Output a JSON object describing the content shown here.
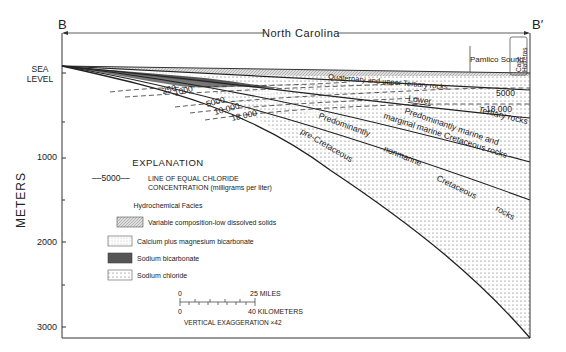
{
  "section": {
    "start_label": "B",
    "end_label": "B′",
    "state_label": "North Carolina",
    "sound_label": "Pamlico Sound",
    "cape_label_1": "Cape",
    "cape_label_2": "Hatteras"
  },
  "axis": {
    "title": "METERS",
    "sea_level_1": "SEA",
    "sea_level_2": "LEVEL",
    "ticks": [
      "1000",
      "2000",
      "3000"
    ]
  },
  "units": {
    "quaternary": "Quaternary and upper Tertiary rocks",
    "lower": "Lower",
    "tertiary": "Tertiary rocks",
    "marine_1": "Predominantly marine and",
    "marine_2": "marginal marine Cretaceous rocks",
    "nonmarine_1": "Predominantly",
    "nonmarine_2": "nonmarine",
    "nonmarine_3": "Cretaceous",
    "nonmarine_4": "rocks",
    "pre_cret": "pre-Cretaceous"
  },
  "isochlors": [
    "250",
    "1000",
    "5000",
    "10,000",
    "18,000",
    "5000",
    "18,000"
  ],
  "legend": {
    "title": "EXPLANATION",
    "line_sample": "––5000––",
    "line_label_1": "LINE OF EQUAL CHLORIDE",
    "line_label_2": "CONCENTRATION (milligrams per liter)",
    "facies_title": "Hydrochemical Facies",
    "facies": [
      {
        "label": "Variable composition-low dissolved solids",
        "pattern": "hatch"
      },
      {
        "label": "Calcium plus magnesium bicarbonate",
        "pattern": "fine-dots"
      },
      {
        "label": "Sodium bicarbonate",
        "pattern": "dark"
      },
      {
        "label": "Sodium chloride",
        "pattern": "dots"
      }
    ]
  },
  "scale": {
    "miles_zero": "0",
    "miles_end": "25 MILES",
    "km_zero": "0",
    "km_end": "40 KILOMETERS",
    "exaggeration": "VERTICAL EXAGGERATION ×42"
  }
}
